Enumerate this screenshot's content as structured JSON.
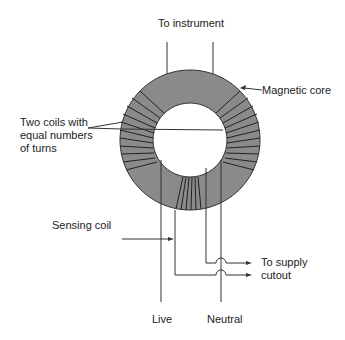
{
  "diagram": {
    "colors": {
      "core_fill": "#8a8a8a",
      "line": "#333333",
      "text": "#222222",
      "background": "#ffffff"
    },
    "labels": {
      "to_instrument": "To instrument",
      "magnetic_core": "Magnetic core",
      "two_coils_line1": "Two coils with",
      "two_coils_line2": "equal numbers",
      "two_coils_line3": "of turns",
      "sensing_coil": "Sensing coil",
      "to_supply_line1": "To supply",
      "to_supply_line2": "cutout",
      "live": "Live",
      "neutral": "Neutral"
    }
  }
}
